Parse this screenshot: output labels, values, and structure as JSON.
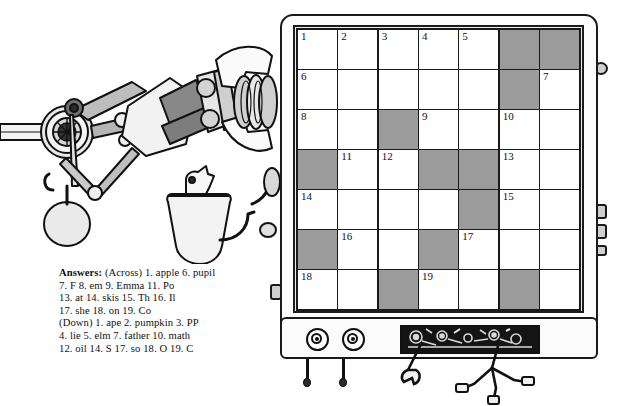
{
  "answers": {
    "label": "Answers:",
    "lines": [
      "(Across)  1. apple  6. pupil",
      "7. F  8. em  9. Emma  11. Po",
      "13. at  14. skis  15. Th  16. Il",
      "17. she  18. on  19. Co",
      "(Down)  1. ape  2. pumpkin  3. PP",
      "4. lie  5. elm  7. father  10. math",
      "12. oil  14. S  17. so  18. O  19. C"
    ],
    "across": [
      {
        "num": "1",
        "word": "apple"
      },
      {
        "num": "6",
        "word": "pupil"
      },
      {
        "num": "7",
        "word": "F"
      },
      {
        "num": "8",
        "word": "em"
      },
      {
        "num": "9",
        "word": "Emma"
      },
      {
        "num": "11",
        "word": "Po"
      },
      {
        "num": "13",
        "word": "at"
      },
      {
        "num": "14",
        "word": "skis"
      },
      {
        "num": "15",
        "word": "Th"
      },
      {
        "num": "16",
        "word": "Il"
      },
      {
        "num": "17",
        "word": "she"
      },
      {
        "num": "18",
        "word": "on"
      },
      {
        "num": "19",
        "word": "Co"
      }
    ],
    "down": [
      {
        "num": "1",
        "word": "ape"
      },
      {
        "num": "2",
        "word": "pumpkin"
      },
      {
        "num": "3",
        "word": "PP"
      },
      {
        "num": "4",
        "word": "lie"
      },
      {
        "num": "5",
        "word": "elm"
      },
      {
        "num": "7",
        "word": "father"
      },
      {
        "num": "10",
        "word": "math"
      },
      {
        "num": "12",
        "word": "oil"
      },
      {
        "num": "14",
        "word": "S"
      },
      {
        "num": "17",
        "word": "so"
      },
      {
        "num": "18",
        "word": "O"
      },
      {
        "num": "19",
        "word": "C"
      }
    ]
  },
  "grid": {
    "rows": 7,
    "cols": 7,
    "cells": [
      [
        {
          "num": "1",
          "blocked": false
        },
        {
          "num": "2",
          "blocked": false
        },
        {
          "num": "3",
          "blocked": false
        },
        {
          "num": "4",
          "blocked": false
        },
        {
          "num": "5",
          "blocked": false
        },
        {
          "num": "",
          "blocked": true
        },
        {
          "num": "",
          "blocked": true
        }
      ],
      [
        {
          "num": "6",
          "blocked": false
        },
        {
          "num": "",
          "blocked": false
        },
        {
          "num": "",
          "blocked": false
        },
        {
          "num": "",
          "blocked": false
        },
        {
          "num": "",
          "blocked": false
        },
        {
          "num": "",
          "blocked": true
        },
        {
          "num": "7",
          "blocked": false
        }
      ],
      [
        {
          "num": "8",
          "blocked": false
        },
        {
          "num": "",
          "blocked": false
        },
        {
          "num": "",
          "blocked": true
        },
        {
          "num": "9",
          "blocked": false
        },
        {
          "num": "",
          "blocked": false
        },
        {
          "num": "10",
          "blocked": false
        },
        {
          "num": "",
          "blocked": false
        }
      ],
      [
        {
          "num": "",
          "blocked": true
        },
        {
          "num": "11",
          "blocked": false
        },
        {
          "num": "12",
          "blocked": false
        },
        {
          "num": "",
          "blocked": true
        },
        {
          "num": "",
          "blocked": true
        },
        {
          "num": "13",
          "blocked": false
        },
        {
          "num": "",
          "blocked": false
        }
      ],
      [
        {
          "num": "14",
          "blocked": false
        },
        {
          "num": "",
          "blocked": false
        },
        {
          "num": "",
          "blocked": false
        },
        {
          "num": "",
          "blocked": false
        },
        {
          "num": "",
          "blocked": true
        },
        {
          "num": "15",
          "blocked": false
        },
        {
          "num": "",
          "blocked": false
        }
      ],
      [
        {
          "num": "",
          "blocked": true
        },
        {
          "num": "16",
          "blocked": false
        },
        {
          "num": "",
          "blocked": false
        },
        {
          "num": "",
          "blocked": true
        },
        {
          "num": "17",
          "blocked": false
        },
        {
          "num": "",
          "blocked": false
        },
        {
          "num": "",
          "blocked": false
        }
      ],
      [
        {
          "num": "18",
          "blocked": false
        },
        {
          "num": "",
          "blocked": false
        },
        {
          "num": "",
          "blocked": true
        },
        {
          "num": "19",
          "blocked": false
        },
        {
          "num": "",
          "blocked": false
        },
        {
          "num": "",
          "blocked": true
        },
        {
          "num": "",
          "blocked": false
        }
      ]
    ]
  },
  "machine": {
    "dials": [
      "dial-left",
      "dial-right"
    ],
    "gear_window_label": "gear-window"
  },
  "colors": {
    "blocked_cell": "#9b9b9b",
    "cell": "#ffffff",
    "ink": "#1a1a1a",
    "panel": "#fbfbfb",
    "gear_window": "#151515"
  }
}
